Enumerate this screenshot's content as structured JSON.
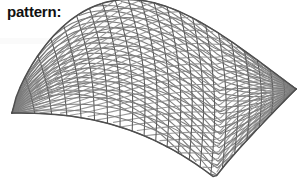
{
  "caption": {
    "label": "pattern:"
  },
  "figure": {
    "name": "gridshell-saddle-surface",
    "type": "3d-wireframe-mesh",
    "background_color": "#ffffff",
    "line_color": "#7c7c7c",
    "line_color_dark": "#5a5a5a",
    "line_color_light": "#9a9a9a",
    "boundary_color": "#4f4f4f",
    "line_width": 1.1,
    "boundary_width": 1.5,
    "grid_u_divisions": 22,
    "grid_v_divisions": 14,
    "lattice_style": "diagonal",
    "canvas": {
      "width": 307,
      "height": 192
    },
    "landmarks": {
      "left_tip": [
        12,
        113
      ],
      "top_apex": [
        160,
        8
      ],
      "right_corner": [
        296,
        89
      ],
      "bottom_corner": [
        215,
        178
      ]
    },
    "projection": {
      "scale": 1.0,
      "yaw_deg": 38,
      "pitch_deg": 24
    }
  }
}
